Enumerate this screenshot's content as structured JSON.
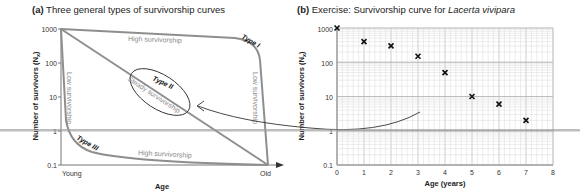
{
  "chart_data": [
    {
      "panel": "a",
      "type": "line",
      "title_prefix": "(a)",
      "title": "Three general types of survivorship curves",
      "xlabel": "Age",
      "ylabel": "Number of survivors (Nx)",
      "yscale": "log",
      "ylim": [
        0.1,
        1000
      ],
      "yticks": [
        "1000",
        "100",
        "10",
        "1",
        "0.1"
      ],
      "xticks": [
        "Young",
        "Old"
      ],
      "series": [
        {
          "name": "Type I",
          "description": "High survivorship then Low survivorship",
          "labels": [
            "High survivorship",
            "Low survivorship"
          ]
        },
        {
          "name": "Type II",
          "description": "Steady survivorship",
          "labels": [
            "Steady survivorship"
          ]
        },
        {
          "name": "Type III",
          "description": "Low survivorship then High survivorship",
          "labels": [
            "Low survivorship",
            "High survivorship"
          ]
        }
      ],
      "grid": false
    },
    {
      "panel": "b",
      "type": "scatter",
      "title_prefix": "(b)",
      "title": "Exercise: Survivorship curve for",
      "title_species": "Lacerta vivipara",
      "xlabel": "Age (years)",
      "ylabel": "Number of survivors (Nx)",
      "yscale": "log",
      "ylim": [
        0.1,
        1000
      ],
      "xlim": [
        0,
        8
      ],
      "yticks": [
        "1000",
        "100",
        "10",
        "1",
        "0.1"
      ],
      "xticks": [
        "0",
        "1",
        "2",
        "3",
        "4",
        "5",
        "6",
        "7",
        "8"
      ],
      "x": [
        0,
        1,
        2,
        3,
        4,
        5,
        6,
        7
      ],
      "values": [
        1000,
        400,
        300,
        150,
        50,
        10,
        6,
        2
      ],
      "marker": "x",
      "grid": true
    }
  ],
  "panel_a": {
    "prefix": "(a)",
    "title": " Three general types of survivorship curves",
    "ylabel": "Number of survivors (N",
    "ylabel_sub": "x",
    "ylabel_end": ")",
    "xlabel": "Age",
    "yticks": [
      "1000",
      "100",
      "10",
      "1",
      "0.1"
    ],
    "x_young": "Young",
    "x_old": "Old",
    "type1": "Type I",
    "type2": "Type II",
    "type3": "Type III",
    "high_surv_top": "High survivorship",
    "low_surv_right": "Low survivorship",
    "steady_surv": "Steady survivorship",
    "low_surv_left": "Low survivorship",
    "high_surv_bottom": "High survivorship"
  },
  "panel_b": {
    "prefix": "(b)",
    "title": " Exercise: Survivorship curve for ",
    "species": "Lacerta vivipara",
    "ylabel": "Number of survivors (N",
    "ylabel_sub": "x",
    "ylabel_end": ")",
    "xlabel": "Age (years)",
    "yticks": [
      "1000",
      "100",
      "10",
      "1",
      "0.1"
    ],
    "xticks": [
      "0",
      "1",
      "2",
      "3",
      "4",
      "5",
      "6",
      "7",
      "8"
    ]
  },
  "colors": {
    "curve": "#8e8e8e",
    "ellipse": "#333333",
    "grid": "#d4d4d4",
    "marker": "#111111",
    "band": "#9a9a9a"
  }
}
